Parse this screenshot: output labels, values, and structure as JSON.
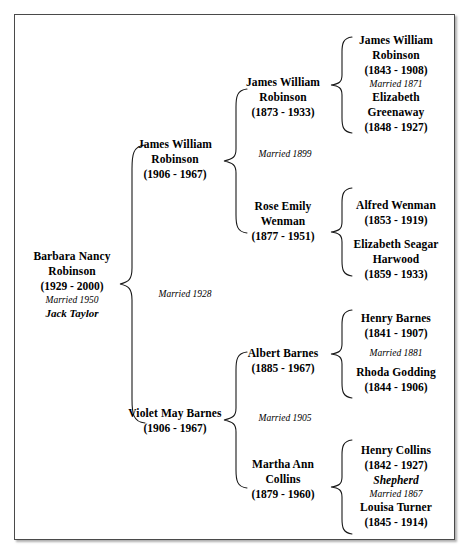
{
  "document": {
    "type": "family-tree-pedigree-chart",
    "border_color": "#4a4a4a"
  },
  "generations": {
    "g1_subject": {
      "name_line1": "Barbara Nancy",
      "name_line2": "Robinson",
      "dates": "(1929 - 2000)",
      "married": "Married 1950",
      "spouse": "Jack Taylor"
    },
    "g2": {
      "father": {
        "name_line1": "James William",
        "name_line2": "Robinson",
        "dates": "(1906 - 1967)"
      },
      "mother": {
        "name_line1": "Violet May Barnes",
        "dates": "(1906 - 1967)"
      },
      "marriage_label": "Married 1928"
    },
    "g3": {
      "paternal_grandfather": {
        "name_line1": "James William",
        "name_line2": "Robinson",
        "dates": "(1873 - 1933)"
      },
      "paternal_grandmother": {
        "name_line1": "Rose Emily",
        "name_line2": "Wenman",
        "dates": "(1877 - 1951)"
      },
      "paternal_marriage_label": "Married 1899",
      "maternal_grandfather": {
        "name_line1": "Albert Barnes",
        "dates": "(1885 - 1967)"
      },
      "maternal_grandmother": {
        "name_line1": "Martha Ann",
        "name_line2": "Collins",
        "dates": "(1879 - 1960)"
      },
      "maternal_marriage_label": "Married 1905"
    },
    "g4": {
      "robinson_couple": {
        "husband": {
          "name_line1": "James William",
          "name_line2": "Robinson",
          "dates": "(1843 - 1908)"
        },
        "married": "Married 1871",
        "wife": {
          "name_line1": "Elizabeth",
          "name_line2": "Greenaway",
          "dates": "(1848 - 1927)"
        }
      },
      "wenman_couple": {
        "husband": {
          "name_line1": "Alfred Wenman",
          "dates": "(1853 - 1919)"
        },
        "wife": {
          "name_line1": "Elizabeth Seagar",
          "name_line2": "Harwood",
          "dates": "(1859 - 1933)"
        }
      },
      "barnes_couple": {
        "husband": {
          "name_line1": "Henry Barnes",
          "dates": "(1841 - 1907)"
        },
        "married": "Married 1881",
        "wife": {
          "name_line1": "Rhoda Godding",
          "dates": "(1844 - 1906)"
        }
      },
      "collins_couple": {
        "husband": {
          "name_line1": "Henry Collins",
          "dates": "(1842 - 1927)",
          "occupation": "Shepherd"
        },
        "married": "Married 1867",
        "wife": {
          "name_line1": "Louisa Turner",
          "dates": "(1845 - 1914)"
        }
      }
    }
  }
}
